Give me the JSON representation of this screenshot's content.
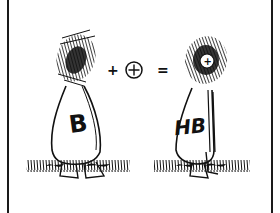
{
  "panel": {
    "style": "hand-drawn ink cartoon",
    "background": "#ffffff",
    "ink": "#111111"
  },
  "left_figure": {
    "body_label": "B",
    "head": "scribbled dark head"
  },
  "equation": {
    "plus": "+",
    "circled_plus": "⊕",
    "equals": "="
  },
  "right_figure": {
    "body_label": "HB",
    "head_symbol": "+",
    "head": "scribbled dark head with circled plus"
  }
}
